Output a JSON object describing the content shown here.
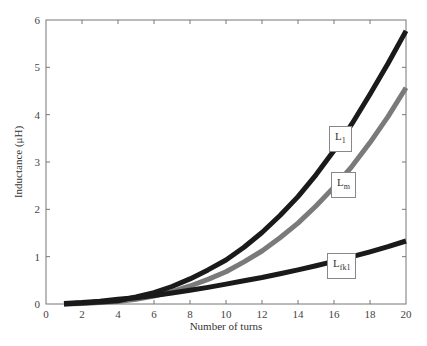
{
  "chart_data": {
    "type": "line",
    "title": "",
    "xlabel": "Number of turns",
    "ylabel": "Inductance (μH)",
    "xlim": [
      0,
      20
    ],
    "ylim": [
      0,
      6
    ],
    "xticks": [
      0,
      2,
      4,
      6,
      8,
      10,
      12,
      14,
      16,
      18,
      20
    ],
    "yticks": [
      0,
      1,
      2,
      3,
      4,
      5,
      6
    ],
    "grid": false,
    "legend_position": "inline labels near curves",
    "x": [
      1,
      2,
      3,
      4,
      5,
      6,
      7,
      8,
      9,
      10,
      11,
      12,
      13,
      14,
      15,
      16,
      17,
      18,
      19,
      20
    ],
    "series": [
      {
        "name": "L1",
        "label_main": "L",
        "label_sub": "1",
        "color": "#1a1a1a",
        "values": [
          0.0,
          0.02,
          0.04,
          0.07,
          0.15,
          0.24,
          0.37,
          0.53,
          0.72,
          0.93,
          1.2,
          1.51,
          1.87,
          2.27,
          2.73,
          3.24,
          3.81,
          4.43,
          5.08,
          5.77
        ]
      },
      {
        "name": "Lm",
        "label_main": "L",
        "label_sub": "m",
        "color": "#7a7a7a",
        "values": [
          0.0,
          0.01,
          0.03,
          0.05,
          0.1,
          0.17,
          0.26,
          0.38,
          0.52,
          0.68,
          0.89,
          1.12,
          1.4,
          1.71,
          2.07,
          2.47,
          2.91,
          3.41,
          3.96,
          4.57
        ]
      },
      {
        "name": "Lfkl",
        "label_main": "L",
        "label_sub": "fk1",
        "color": "#1a1a1a",
        "values": [
          0.01,
          0.03,
          0.06,
          0.1,
          0.13,
          0.18,
          0.23,
          0.29,
          0.35,
          0.42,
          0.49,
          0.56,
          0.64,
          0.72,
          0.81,
          0.9,
          1.0,
          1.1,
          1.21,
          1.33
        ]
      }
    ]
  }
}
